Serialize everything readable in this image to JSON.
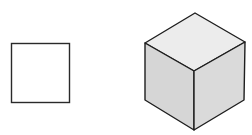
{
  "figure": {
    "shapes": [
      {
        "name": "square",
        "type": "2d",
        "fill": "#ffffff",
        "stroke": "#2a2a2a"
      },
      {
        "name": "cube",
        "type": "3d-isometric",
        "faces": {
          "top": "#ececec",
          "left": "#d6d6d6",
          "right": "#dadada"
        },
        "stroke": "#1e1e1e"
      }
    ]
  }
}
